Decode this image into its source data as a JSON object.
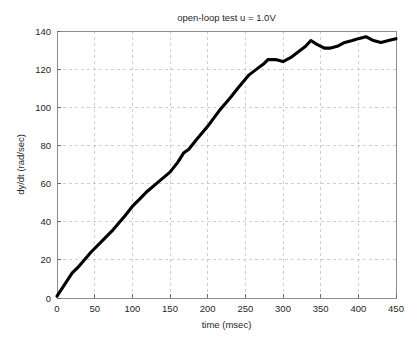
{
  "chart_data": {
    "type": "line",
    "title": "open-loop test u = 1.0V",
    "xlabel": "time (msec)",
    "ylabel": "dy/dt (rad/sec)",
    "xlim": [
      0,
      450
    ],
    "ylim": [
      0,
      140
    ],
    "xticks": [
      0,
      50,
      100,
      150,
      200,
      250,
      300,
      350,
      400,
      450
    ],
    "yticks": [
      0,
      20,
      40,
      60,
      80,
      100,
      120,
      140
    ],
    "xtick_labels": [
      "0",
      "50",
      "100",
      "150",
      "200",
      "250",
      "300",
      "350",
      "400",
      "450"
    ],
    "ytick_labels": [
      "0",
      "20",
      "40",
      "60",
      "80",
      "100",
      "120",
      "140"
    ],
    "grid": true,
    "grid_style": "dashed",
    "legend": false,
    "line_color": "#000000",
    "line_width": 3.1,
    "series": [
      {
        "name": "dy/dt",
        "x": [
          0,
          10,
          20,
          30,
          45,
          60,
          75,
          90,
          100,
          110,
          120,
          135,
          150,
          160,
          168,
          175,
          185,
          200,
          215,
          230,
          240,
          255,
          265,
          275,
          280,
          290,
          300,
          310,
          320,
          330,
          337,
          345,
          355,
          362,
          372,
          382,
          392,
          400,
          410,
          420,
          430,
          440,
          450
        ],
        "y": [
          1,
          7,
          13,
          17,
          24,
          30,
          36,
          43,
          48,
          52,
          56,
          61,
          66,
          71,
          76,
          78,
          83,
          90,
          98,
          105,
          110,
          117,
          120,
          123,
          125,
          125,
          124,
          126,
          129,
          132,
          135,
          133,
          131,
          131,
          132,
          134,
          135,
          136,
          137,
          135,
          134,
          135,
          136
        ]
      }
    ]
  },
  "figure": {
    "background_color": "#ffffff",
    "axes_color": "#8d8d8d",
    "grid_color": "#b9b9b9",
    "text_color": "#262626"
  }
}
